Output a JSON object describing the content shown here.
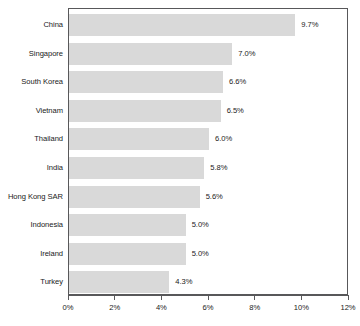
{
  "chart_data": {
    "type": "bar",
    "orientation": "horizontal",
    "title": "",
    "subtitle": "",
    "xlabel": "",
    "ylabel": "",
    "xlim": [
      0,
      12
    ],
    "grid": false,
    "legend": null,
    "categories": [
      "China",
      "Singapore",
      "South Korea",
      "Vietnam",
      "Thailand",
      "India",
      "Hong Kong SAR",
      "Indonesia",
      "Ireland",
      "Turkey"
    ],
    "values": [
      9.7,
      7.0,
      6.6,
      6.5,
      6.0,
      5.8,
      5.6,
      5.0,
      5.0,
      4.3
    ],
    "data_labels": [
      "9.7%",
      "7.0%",
      "6.6%",
      "6.5%",
      "6.0%",
      "5.8%",
      "5.6%",
      "5.0%",
      "5.0%",
      "4.3%"
    ],
    "x_ticks": [
      0,
      2,
      4,
      6,
      8,
      10,
      12
    ],
    "x_tick_labels": [
      "0%",
      "2%",
      "4%",
      "6%",
      "8%",
      "10%",
      "12%"
    ],
    "bar_color": "#d9d9d9",
    "axis_color": "#58585a",
    "text_color": "#1a1a1a",
    "background_color": "#ffffff"
  }
}
